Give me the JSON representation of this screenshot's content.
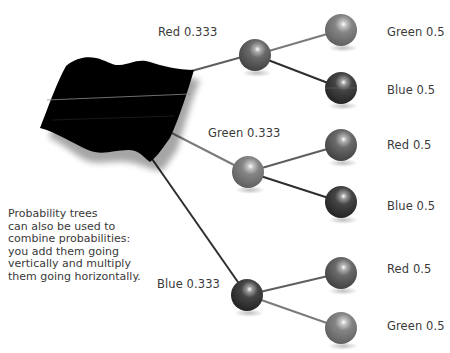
{
  "diagram": {
    "type": "probability-tree",
    "root": {
      "name": "bag-of-marbles",
      "shape": "black-cloth"
    },
    "level1": [
      {
        "label": "Red 0.333",
        "color": "Red",
        "probability": 0.333,
        "shade": "#5a5a5a"
      },
      {
        "label": "Green 0.333",
        "color": "Green",
        "probability": 0.333,
        "shade": "#7a7a7a"
      },
      {
        "label": "Blue 0.333",
        "color": "Blue",
        "probability": 0.333,
        "shade": "#3a3a3a"
      }
    ],
    "level2": [
      {
        "parent": "Red",
        "label": "Green 0.5",
        "color": "Green",
        "probability": 0.5,
        "shade": "#7a7a7a"
      },
      {
        "parent": "Red",
        "label": "Blue 0.5",
        "color": "Blue",
        "probability": 0.5,
        "shade": "#3a3a3a"
      },
      {
        "parent": "Green",
        "label": "Red 0.5",
        "color": "Red",
        "probability": 0.5,
        "shade": "#5a5a5a"
      },
      {
        "parent": "Green",
        "label": "Blue 0.5",
        "color": "Blue",
        "probability": 0.5,
        "shade": "#3a3a3a"
      },
      {
        "parent": "Blue",
        "label": "Red 0.5",
        "color": "Red",
        "probability": 0.5,
        "shade": "#5a5a5a"
      },
      {
        "parent": "Blue",
        "label": "Green 0.5",
        "color": "Green",
        "probability": 0.5,
        "shade": "#7a7a7a"
      }
    ],
    "caption": [
      "Probability trees",
      "can also be used to",
      "combine probabilities:",
      "you add them going",
      "vertically and multiply",
      "them going horizontally."
    ],
    "colors": {
      "background": "#ffffff",
      "text": "#3a3a3a",
      "root_fill": "#000000",
      "edge_red": "#5e5e5e",
      "edge_green": "#7a7a7a",
      "edge_blue": "#2e2e2e"
    }
  }
}
